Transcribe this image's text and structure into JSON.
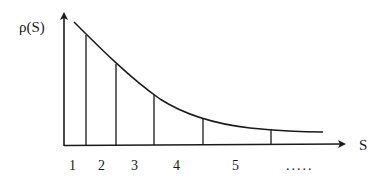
{
  "diagram": {
    "y_axis_label": "ρ(S)",
    "x_axis_label": "S",
    "curve": "decreasing convex curve (power-law / exponential decay)",
    "bins": [
      {
        "label": "1"
      },
      {
        "label": "2"
      },
      {
        "label": "3"
      },
      {
        "label": "4"
      },
      {
        "label": "5"
      },
      {
        "label": "....."
      }
    ],
    "bin_boundaries_note": "vertical lines under the curve with increasing widths",
    "line_color": "#1a1a1a",
    "background": "#ffffff"
  }
}
